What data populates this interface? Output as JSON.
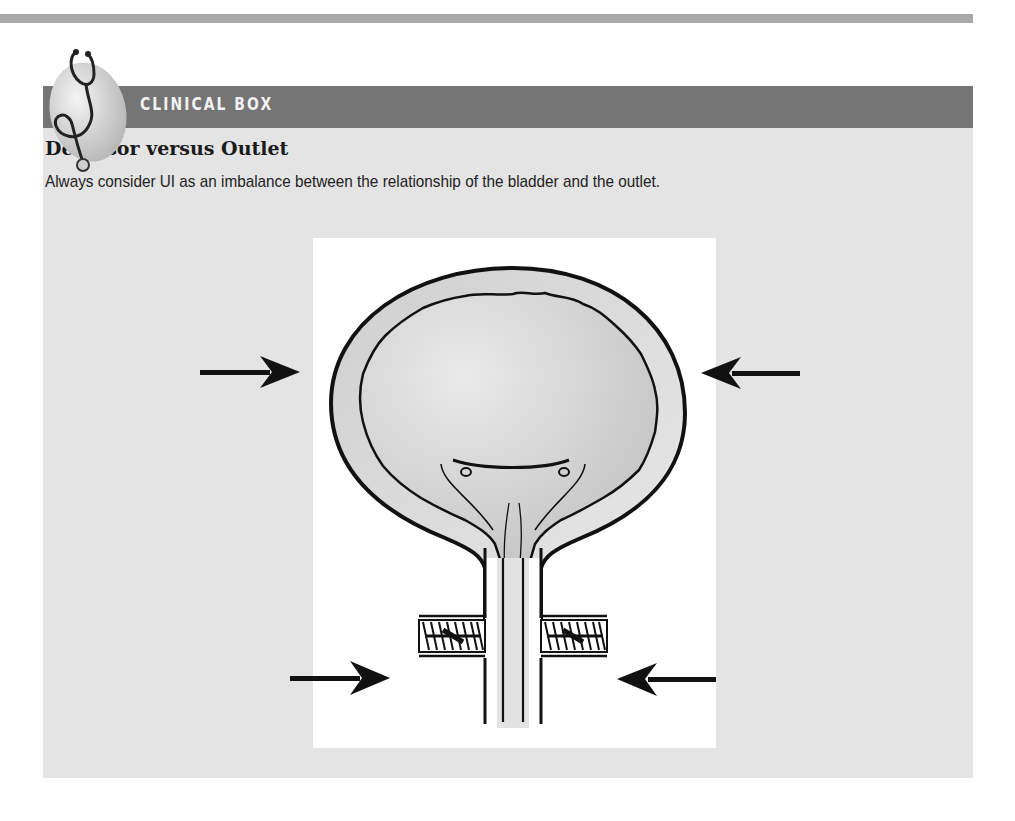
{
  "box": {
    "label": "CLINICAL BOX",
    "icon": "stethoscope-icon",
    "heading": "Detrusor versus Outlet",
    "description": "Always consider UI as an imbalance between the relationship of the bladder and the outlet."
  },
  "figure": {
    "arrows": [
      "arrow-right-upper-left",
      "arrow-left-upper-right",
      "arrow-right-lower-left",
      "arrow-left-lower-right"
    ]
  },
  "colors": {
    "header_band": "#757575",
    "box_body": "#e4e4e4",
    "top_rule": "#a9a9a9"
  }
}
